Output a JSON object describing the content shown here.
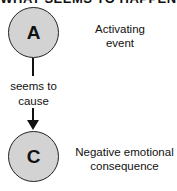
{
  "diagram": {
    "title": "WHAT SEEMS TO HAPPEN",
    "nodes": [
      {
        "id": "A",
        "letter": "A",
        "label_line1": "Activating",
        "label_line2": "event"
      },
      {
        "id": "C",
        "letter": "C",
        "label_line1": "Negative emotional",
        "label_line2": "consequence"
      }
    ],
    "edge": {
      "from": "A",
      "to": "C",
      "label_line1": "seems to",
      "label_line2": "cause"
    },
    "colors": {
      "node_fill": "#d3d3d3",
      "stroke": "#222222",
      "text": "#111111"
    }
  }
}
